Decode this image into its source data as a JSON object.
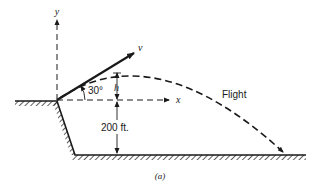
{
  "figure": {
    "caption": "(a)",
    "labels": {
      "y_axis": "y",
      "x_axis": "x",
      "velocity": "v",
      "angle": "30°",
      "height_above": "h",
      "cliff_height": "200 ft.",
      "trajectory": "Flight"
    },
    "colors": {
      "ink": "#1a1a1a",
      "background": "#ffffff"
    }
  }
}
